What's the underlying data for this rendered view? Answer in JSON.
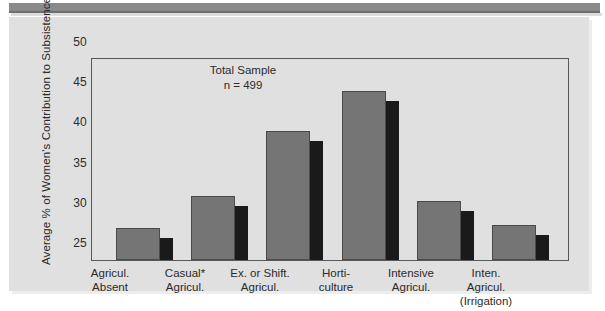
{
  "chart_data": {
    "type": "bar",
    "title": "",
    "subtitle": "",
    "xlabel": "",
    "ylabel": "Average % of Women's Contribution to Subsistence",
    "ylim": [
      25,
      50
    ],
    "ytick_labels": [
      "50",
      "45",
      "40",
      "35",
      "30",
      "25"
    ],
    "ytick_values": [
      50,
      45,
      40,
      35,
      30,
      25
    ],
    "grid": false,
    "legend": null,
    "annotations": [
      "Total Sample",
      "n = 499"
    ],
    "categories": [
      "Agricul.\nAbsent",
      "Casual*\nAgricul.",
      "Ex. or Shift.\nAgricul.",
      "Horti-\nculture",
      "Intensive\nAgricul.",
      "Inten.\nAgricul.\n(Irrigation)"
    ],
    "category_lines": [
      [
        "Agricul.",
        "Absent"
      ],
      [
        "Casual*",
        "Agricul."
      ],
      [
        "Ex. or Shift.",
        "Agricul."
      ],
      [
        "Horti-",
        "culture"
      ],
      [
        "Intensive",
        "Agricul."
      ],
      [
        "Inten.",
        "Agricul.",
        "(Irrigation)"
      ]
    ],
    "values": [
      29,
      33,
      41,
      46,
      32.3,
      29.3
    ],
    "colors": {
      "bar_face": "#757575",
      "bar_side": "#1a1a1a",
      "bar_edge": "#4a4a4a",
      "plot_background": "#e0e0e0",
      "panel_background": "#e0e0e0",
      "axis": "#585858",
      "text": "#2b2b2b",
      "top_rule": "#8a8a8a"
    }
  },
  "annotation": {
    "line1": "Total Sample",
    "line2": "n = 499"
  },
  "axis": {
    "y_title": "Average % of Women's Contribution to Subsistence",
    "ticks": [
      "50",
      "45",
      "40",
      "35",
      "30",
      "25"
    ]
  },
  "xlabels": [
    {
      "l1": "Agricul.",
      "l2": "Absent",
      "l3": ""
    },
    {
      "l1": "Casual*",
      "l2": "Agricul.",
      "l3": ""
    },
    {
      "l1": "Ex. or Shift.",
      "l2": "Agricul.",
      "l3": ""
    },
    {
      "l1": "Horti-",
      "l2": "culture",
      "l3": ""
    },
    {
      "l1": "Intensive",
      "l2": "Agricul.",
      "l3": ""
    },
    {
      "l1": "Inten.",
      "l2": "Agricul.",
      "l3": "(Irrigation)"
    }
  ]
}
